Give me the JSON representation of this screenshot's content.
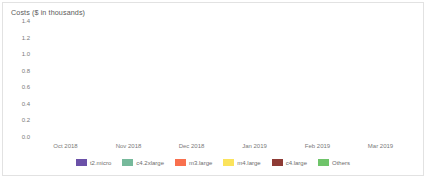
{
  "chart_data": {
    "type": "bar",
    "title": "Costs ($ in thousands)",
    "xlabel": "",
    "ylabel": "",
    "ylim": [
      0.0,
      1.4
    ],
    "yticks": [
      "1.4",
      "1.2",
      "1.0",
      "0.8",
      "0.6",
      "0.4",
      "0.2",
      "0.0"
    ],
    "ytick_values": [
      1.4,
      1.2,
      1.0,
      0.8,
      0.6,
      0.4,
      0.2,
      0.0
    ],
    "grid": false,
    "stacked": true,
    "legend_position": "bottom",
    "categories": [
      "Oct 2018",
      "Nov 2018",
      "Dec 2018",
      "Jan 2019",
      "Feb 2019",
      "Mar 2019"
    ],
    "series": [
      {
        "name": "t2.micro",
        "color": "#6B51A8",
        "values": [
          0.49,
          0.48,
          0.42,
          0.46,
          0.44,
          0.45
        ]
      },
      {
        "name": "c4.2xlarge",
        "color": "#76B99B",
        "values": [
          0.22,
          0.26,
          0.26,
          0.22,
          0.17,
          0.25
        ]
      },
      {
        "name": "m3.large",
        "color": "#F9704E",
        "values": [
          0.12,
          0.12,
          0.11,
          0.12,
          0.13,
          0.12
        ]
      },
      {
        "name": "m4.large",
        "color": "#FBE35C",
        "values": [
          0.09,
          0.08,
          0.07,
          0.09,
          0.08,
          0.09
        ]
      },
      {
        "name": "c4.large",
        "color": "#8E3B35",
        "values": [
          0.08,
          0.07,
          0.08,
          0.07,
          0.07,
          0.08
        ]
      },
      {
        "name": "Others",
        "color": "#6FC46A",
        "values": [
          0.3,
          0.31,
          0.19,
          0.17,
          0.14,
          0.16
        ]
      }
    ],
    "totals": [
      1.3,
      1.32,
      1.13,
      1.13,
      1.03,
      1.15
    ]
  }
}
